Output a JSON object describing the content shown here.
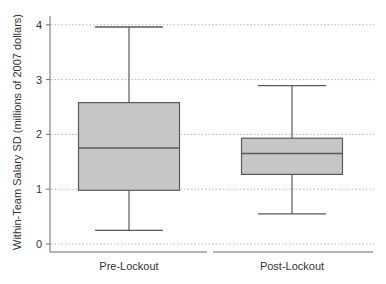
{
  "chart_data": {
    "type": "box",
    "title": "",
    "xlabel": "",
    "ylabel": "Within-Team Salary SD (millions of 2007 dollars)",
    "ylim": [
      0,
      4
    ],
    "yticks": [
      0,
      1,
      2,
      3,
      4
    ],
    "grid": "horizontal dotted",
    "legend": "none",
    "categories": [
      "Pre-Lockout",
      "Post-Lockout"
    ],
    "series": [
      {
        "name": "Pre-Lockout",
        "whisker_low": 0.25,
        "q1": 0.98,
        "median": 1.75,
        "q3": 2.58,
        "whisker_high": 3.96
      },
      {
        "name": "Post-Lockout",
        "whisker_low": 0.55,
        "q1": 1.27,
        "median": 1.65,
        "q3": 1.93,
        "whisker_high": 2.89
      }
    ]
  },
  "colors": {
    "box_fill": "#c6c6c6",
    "line": "#5a5a5a",
    "axis": "#6a6a6a",
    "grid": "#b5b5b5",
    "text": "#333333"
  }
}
